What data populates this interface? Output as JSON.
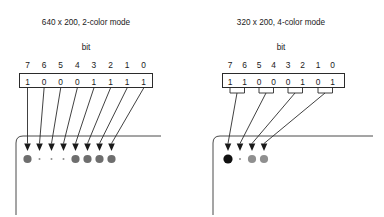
{
  "figure": {
    "bit_label": "bit",
    "diagrams": [
      {
        "id": "mode-640-2color",
        "title": "640 x 200, 2-color mode",
        "bit_numbers": [
          "7",
          "6",
          "5",
          "4",
          "3",
          "2",
          "1",
          "0"
        ],
        "bit_values": [
          "1",
          "0",
          "0",
          "0",
          "1",
          "1",
          "1",
          "1"
        ],
        "bits_per_pixel": 1,
        "pixels": [
          {
            "index": 0,
            "bits": "1",
            "color": "#6e6e6e",
            "size": "large"
          },
          {
            "index": 1,
            "bits": "0",
            "color": "#8f8f8f",
            "size": "tiny"
          },
          {
            "index": 2,
            "bits": "0",
            "color": "#8f8f8f",
            "size": "tiny"
          },
          {
            "index": 3,
            "bits": "0",
            "color": "#8f8f8f",
            "size": "tiny"
          },
          {
            "index": 4,
            "bits": "1",
            "color": "#6e6e6e",
            "size": "large"
          },
          {
            "index": 5,
            "bits": "1",
            "color": "#6e6e6e",
            "size": "large"
          },
          {
            "index": 6,
            "bits": "1",
            "color": "#6e6e6e",
            "size": "large"
          },
          {
            "index": 7,
            "bits": "1",
            "color": "#6e6e6e",
            "size": "large"
          }
        ]
      },
      {
        "id": "mode-320-4color",
        "title": "320 x 200, 4-color mode",
        "bit_numbers": [
          "7",
          "6",
          "5",
          "4",
          "3",
          "2",
          "1",
          "0"
        ],
        "bit_values": [
          "1",
          "1",
          "0",
          "0",
          "0",
          "1",
          "0",
          "1"
        ],
        "bits_per_pixel": 2,
        "pixels": [
          {
            "index": 0,
            "bits": "11",
            "color": "#111111",
            "size": "large"
          },
          {
            "index": 1,
            "bits": "00",
            "color": "#8f8f8f",
            "size": "tiny"
          },
          {
            "index": 2,
            "bits": "01",
            "color": "#8f8f8f",
            "size": "large"
          },
          {
            "index": 3,
            "bits": "01",
            "color": "#8f8f8f",
            "size": "large"
          }
        ]
      }
    ],
    "colors": {
      "line": "#2b2b2b",
      "screen_outline": "#4a4a4a",
      "text": "#1a1a1a",
      "background": "#ffffff"
    }
  }
}
